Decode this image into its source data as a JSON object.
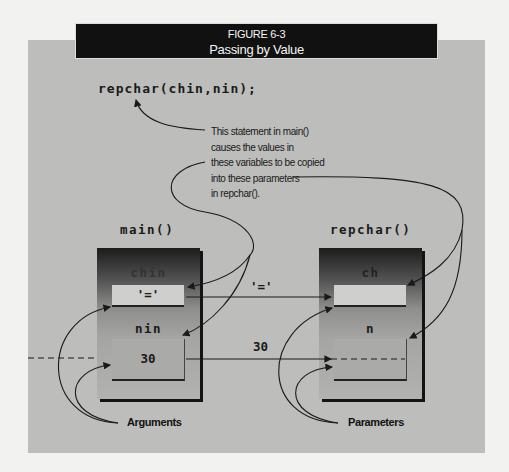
{
  "figure": {
    "number": "FIGURE 6-3",
    "title": "Passing by Value"
  },
  "code_statement": "repchar(chin,nin);",
  "annotation": [
    "This statement in main()",
    "causes the values in",
    "these variables to be copied",
    "into these parameters",
    "in repchar()."
  ],
  "caller": {
    "label": "main()",
    "variables": [
      {
        "name": "chin",
        "value": "'='"
      },
      {
        "name": "nin",
        "value": "30"
      }
    ],
    "group_label": "Arguments"
  },
  "callee": {
    "label": "repchar()",
    "variables": [
      {
        "name": "ch",
        "value": ""
      },
      {
        "name": "n",
        "value": ""
      }
    ],
    "group_label": "Parameters"
  },
  "transfers": [
    {
      "from": "chin",
      "to": "ch",
      "value": "'='"
    },
    {
      "from": "nin",
      "to": "n",
      "value": "30"
    }
  ],
  "colors": {
    "title_bar": "#111111",
    "panel": "#bdbdbb",
    "background": "#f2f2f0"
  }
}
